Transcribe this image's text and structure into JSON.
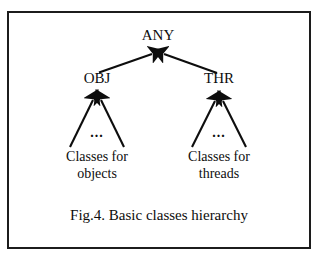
{
  "figure": {
    "caption": "Fig.4. Basic classes hierarchy",
    "frame_color": "#1c1c1c",
    "background_color": "#ffffff",
    "ink_color": "#0d0d0d"
  },
  "diagram": {
    "type": "class-hierarchy-tree",
    "root": {
      "label": "ANY"
    },
    "branches": [
      {
        "label": "OBJ",
        "ellipsis": "...",
        "leaf_label": "Classes for\nobjects"
      },
      {
        "label": "THR",
        "ellipsis": "...",
        "leaf_label": "Classes for\nthreads"
      }
    ],
    "edges": [
      {
        "from": "OBJ",
        "to": "ANY",
        "arrow": "up"
      },
      {
        "from": "THR",
        "to": "ANY",
        "arrow": "up"
      },
      {
        "from": "Classes for objects",
        "to": "OBJ",
        "arrow": "up"
      },
      {
        "from": "Classes for objects",
        "to": "OBJ",
        "arrow": "up"
      },
      {
        "from": "Classes for threads",
        "to": "THR",
        "arrow": "up"
      },
      {
        "from": "Classes for threads",
        "to": "THR",
        "arrow": "up"
      }
    ]
  }
}
